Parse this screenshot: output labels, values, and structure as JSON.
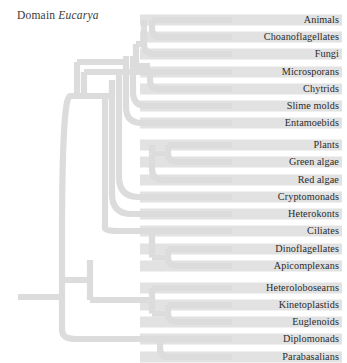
{
  "title": {
    "prefix": "Domain ",
    "taxon": "Eucarya",
    "full": "Domain Eucarya"
  },
  "colors": {
    "branch": "#dcdcdc",
    "band": "#e2e2e2",
    "text": "#2b2b2b",
    "title_text": "#3a3a3a",
    "background": "#ffffff"
  },
  "chart_data": {
    "type": "tree",
    "title": "Domain Eucarya",
    "orientation": "left-to-right",
    "root_label": "Eucarya",
    "tip_count": 20,
    "groups": [
      {
        "name": "Opisthokonts and amoebozoans",
        "tips": [
          "Animals",
          "Choanoflagellates",
          "Fungi",
          "Microsporans",
          "Chytrids",
          "Slime molds",
          "Entamoebids"
        ]
      },
      {
        "name": "Plants, algae and chromalveolates",
        "tips": [
          "Plants",
          "Green algae",
          "Red algae",
          "Cryptomonads",
          "Heterokonts",
          "Ciliates",
          "Dinoflagellates",
          "Apicomplexans"
        ]
      },
      {
        "name": "Excavates",
        "tips": [
          "Heterolobosearns",
          "Kinetoplastids",
          "Euglenoids",
          "Diplomonads",
          "Parabasalians"
        ]
      }
    ],
    "tips": [
      {
        "index": 0,
        "label": "Animals",
        "y": 20
      },
      {
        "index": 1,
        "label": "Choanoflagellates",
        "y": 37
      },
      {
        "index": 2,
        "label": "Fungi",
        "y": 54
      },
      {
        "index": 3,
        "label": "Microsporans",
        "y": 72
      },
      {
        "index": 4,
        "label": "Chytrids",
        "y": 89
      },
      {
        "index": 5,
        "label": "Slime molds",
        "y": 106
      },
      {
        "index": 6,
        "label": "Entamoebids",
        "y": 123
      },
      {
        "index": 7,
        "label": "Plants",
        "y": 145
      },
      {
        "index": 8,
        "label": "Green algae",
        "y": 162
      },
      {
        "index": 9,
        "label": "Red algae",
        "y": 180
      },
      {
        "index": 10,
        "label": "Cryptomonads",
        "y": 197
      },
      {
        "index": 11,
        "label": "Heterokonts",
        "y": 214
      },
      {
        "index": 12,
        "label": "Ciliates",
        "y": 231
      },
      {
        "index": 13,
        "label": "Dinoflagellates",
        "y": 249
      },
      {
        "index": 14,
        "label": "Apicomplexans",
        "y": 266
      },
      {
        "index": 15,
        "label": "Heterolobosearns",
        "y": 288
      },
      {
        "index": 16,
        "label": "Kinetoplastids",
        "y": 305
      },
      {
        "index": 17,
        "label": "Euglenoids",
        "y": 322
      },
      {
        "index": 18,
        "label": "Diplomonads",
        "y": 339
      },
      {
        "index": 19,
        "label": "Parabasalians",
        "y": 357
      }
    ]
  }
}
